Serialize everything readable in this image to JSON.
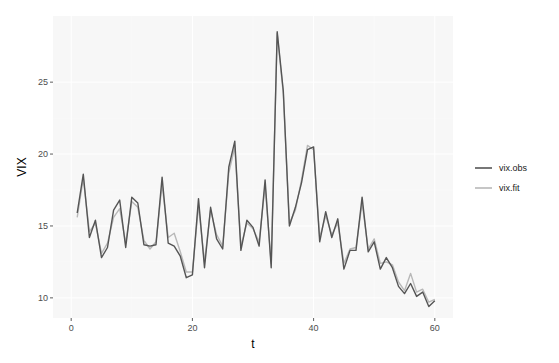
{
  "chart_data": {
    "type": "line",
    "title": "",
    "xlabel": "t",
    "ylabel": "VIX",
    "xlim": [
      -3,
      63
    ],
    "ylim": [
      8.6,
      29.6
    ],
    "x_ticks": [
      0,
      20,
      40,
      60
    ],
    "y_ticks": [
      10,
      15,
      20,
      25
    ],
    "grid": true,
    "legend_position": "right",
    "x": [
      1,
      2,
      3,
      4,
      5,
      6,
      7,
      8,
      9,
      10,
      11,
      12,
      13,
      14,
      15,
      16,
      17,
      18,
      19,
      20,
      21,
      22,
      23,
      24,
      25,
      26,
      27,
      28,
      29,
      30,
      31,
      32,
      33,
      34,
      35,
      36,
      37,
      38,
      39,
      40,
      41,
      42,
      43,
      44,
      45,
      46,
      47,
      48,
      49,
      50,
      51,
      52,
      53,
      54,
      55,
      56,
      57,
      58,
      59,
      60
    ],
    "series": [
      {
        "name": "vix.obs",
        "color": "#555555",
        "values": [
          15.9,
          18.6,
          14.2,
          15.4,
          12.8,
          13.5,
          16.1,
          16.8,
          13.5,
          17.0,
          16.6,
          13.7,
          13.6,
          13.7,
          18.4,
          13.8,
          13.6,
          12.9,
          11.4,
          11.6,
          16.9,
          12.1,
          16.3,
          14.1,
          13.4,
          19.1,
          20.9,
          13.3,
          15.4,
          14.9,
          13.6,
          18.2,
          12.1,
          28.5,
          24.4,
          15.0,
          16.3,
          18.0,
          20.3,
          20.5,
          13.9,
          16.0,
          14.2,
          15.5,
          12.0,
          13.3,
          13.3,
          17.0,
          13.2,
          13.9,
          12.0,
          12.8,
          12.1,
          10.8,
          10.3,
          11.0,
          10.1,
          10.4,
          9.4,
          9.8
        ]
      },
      {
        "name": "vix.fit",
        "color": "#b8b8b8",
        "values": [
          15.6,
          18.3,
          14.6,
          15.2,
          13.1,
          13.8,
          15.6,
          16.2,
          13.8,
          16.7,
          16.3,
          14.0,
          13.4,
          13.9,
          17.9,
          14.2,
          14.5,
          13.2,
          11.8,
          11.8,
          16.4,
          12.5,
          16.1,
          14.4,
          13.6,
          18.7,
          20.5,
          13.6,
          15.2,
          14.8,
          13.9,
          17.8,
          12.4,
          28.4,
          24.2,
          15.2,
          16.1,
          18.2,
          20.6,
          20.3,
          14.2,
          15.7,
          14.4,
          15.2,
          12.4,
          13.4,
          13.5,
          16.6,
          13.4,
          14.1,
          12.4,
          12.5,
          12.3,
          11.1,
          10.5,
          11.7,
          10.4,
          10.6,
          9.7,
          9.9
        ]
      }
    ]
  },
  "legend": {
    "items": [
      {
        "label": "vix.obs",
        "color": "#555555"
      },
      {
        "label": "vix.fit",
        "color": "#b8b8b8"
      }
    ]
  },
  "axes": {
    "xlabel": "t",
    "ylabel": "VIX",
    "x_tick_labels": [
      "0",
      "20",
      "40",
      "60"
    ],
    "y_tick_labels": [
      "10",
      "15",
      "20",
      "25"
    ]
  },
  "style": {
    "panel_bg": "#f7f7f7",
    "grid_major": "#ffffff",
    "grid_minor": "#fbfbfb"
  }
}
